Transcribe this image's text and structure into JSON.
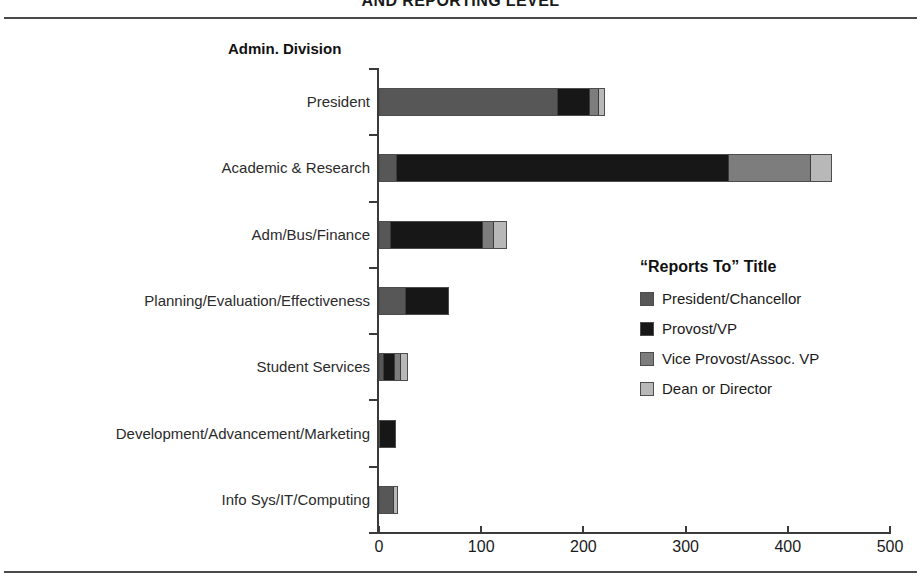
{
  "title": "AND REPORTING LEVEL",
  "axis_title_y": "Admin. Division",
  "legend": {
    "title": "“Reports To”  Title",
    "items": [
      {
        "label": "President/Chancellor",
        "color": "#575757"
      },
      {
        "label": "Provost/VP",
        "color": "#171717"
      },
      {
        "label": "Vice Provost/Assoc. VP",
        "color": "#7d7d7d"
      },
      {
        "label": "Dean or Director",
        "color": "#b8b8b8"
      }
    ]
  },
  "xaxis": {
    "ticks": [
      "0",
      "100",
      "200",
      "300",
      "400",
      "500"
    ],
    "min": 0,
    "max": 500
  },
  "chart_data": {
    "type": "bar",
    "orientation": "horizontal",
    "stacked": true,
    "title": "AND REPORTING LEVEL",
    "xlabel": "",
    "ylabel": "Admin. Division",
    "xlim": [
      0,
      500
    ],
    "xticks": [
      0,
      100,
      200,
      300,
      400,
      500
    ],
    "grid": false,
    "legend_position": "right-middle",
    "legend_title": "“Reports To”  Title",
    "categories": [
      "President",
      "Academic & Research",
      "Adm/Bus/Finance",
      "Planning/Evaluation/Effectiveness",
      "Student Services",
      "Development/Advancement/Marketing",
      "Info Sys/IT/Computing"
    ],
    "series": [
      {
        "name": "President/Chancellor",
        "color": "#575757",
        "values": [
          173,
          16,
          10,
          24,
          3,
          0,
          13
        ]
      },
      {
        "name": "Provost/VP",
        "color": "#171717",
        "values": [
          31,
          324,
          89,
          42,
          10,
          15,
          0
        ]
      },
      {
        "name": "Vice Provost/Assoc. VP",
        "color": "#7d7d7d",
        "values": [
          7,
          79,
          10,
          0,
          5,
          0,
          0
        ]
      },
      {
        "name": "Dean or Director",
        "color": "#b8b8b8",
        "values": [
          5,
          19,
          11,
          0,
          5,
          0,
          3
        ]
      }
    ],
    "totals": [
      216,
      438,
      120,
      66,
      23,
      15,
      16
    ]
  }
}
